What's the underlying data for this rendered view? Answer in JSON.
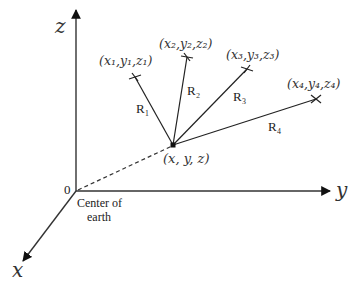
{
  "axes": {
    "z_label": "z",
    "y_label": "y",
    "x_label": "x",
    "origin_label": "0",
    "origin_caption_line1": "Center of",
    "origin_caption_line2": "earth"
  },
  "receiver": {
    "label": "(x, y, z)"
  },
  "satellites": [
    {
      "label": "(x₁,y₁,z₁)",
      "range_label": "R₁"
    },
    {
      "label": "(x₂,y₂,z₂)",
      "range_label": "R₂"
    },
    {
      "label": "(x₃,y₃,z₃)",
      "range_label": "R₃"
    },
    {
      "label": "(x₄,y₄,z₄)",
      "range_label": "R₄"
    }
  ]
}
